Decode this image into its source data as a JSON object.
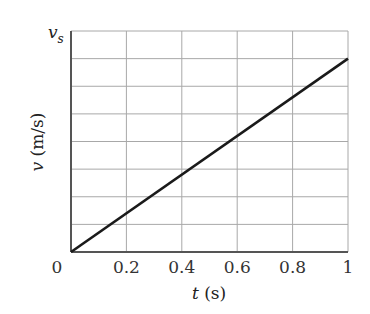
{
  "chart_data": {
    "type": "line",
    "title": "",
    "xlabel": "t (s)",
    "xlabel_var": "t",
    "xlabel_unit": "(s)",
    "ylabel": "v (m/s)",
    "ylabel_var": "v",
    "ylabel_unit": "(m/s)",
    "y_top_label": "v",
    "y_top_label_sub": "s",
    "xlim": [
      0,
      1
    ],
    "ylim": [
      0,
      1
    ],
    "x_ticks": [
      "0",
      "0.2",
      "0.4",
      "0.6",
      "0.8",
      "1"
    ],
    "y_gridlines": 8,
    "grid": true,
    "series": [
      {
        "name": "v(t)",
        "x": [
          0,
          1
        ],
        "y": [
          0,
          0.875
        ],
        "color": "#1a1a1a"
      }
    ],
    "note": "y values as fraction of v_s; line reaches 7/8 of v_s at t = 1 s"
  }
}
